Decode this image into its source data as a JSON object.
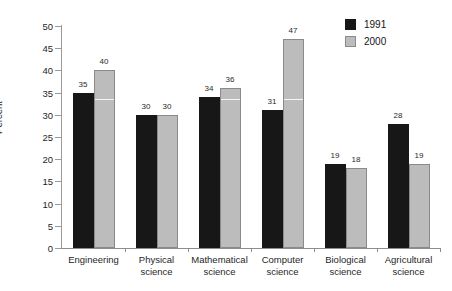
{
  "chart_data": {
    "type": "bar",
    "title": "",
    "xlabel": "",
    "ylabel": "Percent",
    "ylim": [
      0,
      50
    ],
    "yticks": [
      "0",
      "5",
      "10",
      "15",
      "20",
      "25",
      "30",
      "35",
      "40",
      "45",
      "50"
    ],
    "grid": false,
    "legend_position": "top-right",
    "categories": [
      "Engineering",
      "Physical\nscience",
      "Mathematical\nscience",
      "Computer\nscience",
      "Biological\nscience",
      "Agricultural\nscience"
    ],
    "series": [
      {
        "name": "1991",
        "color": "#171717",
        "values": [
          35,
          30,
          34,
          31,
          19,
          28
        ],
        "labels": [
          "35",
          "30",
          "34",
          "31",
          "19",
          "28"
        ]
      },
      {
        "name": "2000",
        "color": "#bcbcbc",
        "values": [
          40,
          30,
          36,
          47,
          18,
          19
        ],
        "labels": [
          "40",
          "30",
          "36",
          "47",
          "18",
          "19"
        ]
      }
    ]
  },
  "legend": {
    "entries": [
      {
        "label": "1991",
        "swatch": "dark-square-swatch"
      },
      {
        "label": "2000",
        "swatch": "light-square-swatch"
      }
    ]
  }
}
